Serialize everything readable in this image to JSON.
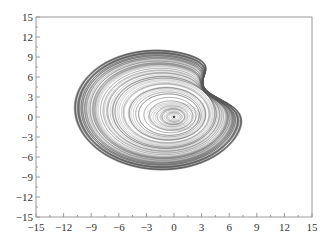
{
  "chart_data": {
    "type": "line",
    "title": "",
    "xlabel": "",
    "ylabel": "",
    "xlim": [
      -15,
      15
    ],
    "ylim": [
      -15,
      15
    ],
    "grid": false,
    "legend": null,
    "xticks": [
      -15,
      -12,
      -9,
      -6,
      -3,
      0,
      3,
      6,
      9,
      12,
      15
    ],
    "yticks": [
      -15,
      -12,
      -9,
      -6,
      -3,
      0,
      3,
      6,
      9,
      12,
      15
    ],
    "xtick_labels": [
      "−15",
      "−12",
      "−9",
      "−6",
      "−3",
      "0",
      "3",
      "6",
      "9",
      "12",
      "15"
    ],
    "ytick_labels": [
      "−15",
      "−12",
      "−9",
      "−6",
      "−3",
      "0",
      "3",
      "6",
      "9",
      "12",
      "15"
    ],
    "minor_tick_step": 1.5,
    "series": [
      {
        "name": "chaotic attractor trajectory (phase portrait)",
        "description": "Dense spiral trajectory around a focus at (0,0); outer band tilted ellipse with a fold/crossing in the upper-right",
        "center": [
          0,
          0
        ],
        "extent": {
          "x_min": -11,
          "x_max": 7.8,
          "y_min": -9.2,
          "y_max": 11.3
        },
        "color": "#555555"
      }
    ]
  },
  "plot_area": {
    "left": 36,
    "top": 17,
    "right": 312,
    "bottom": 217
  },
  "colors": {
    "frame": "#9a9a9a",
    "trajectory": "#555555",
    "text": "#333333"
  }
}
